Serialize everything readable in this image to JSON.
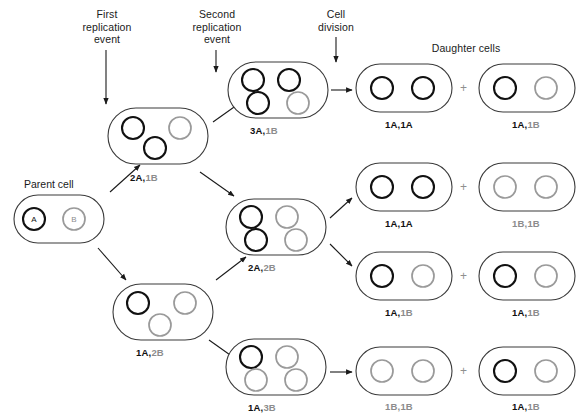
{
  "figure": {
    "colors": {
      "plasmid_a": "#111111",
      "plasmid_b": "#9a9a9a",
      "cell_outline": "#3b3b3b",
      "arrow": "#1a1a1a",
      "text": "#1a1a1a",
      "text_gray": "#8c8c8c"
    }
  },
  "headers": [
    {
      "id": "first-replication-event",
      "text": "First\nreplication\nevent",
      "x": 76,
      "y": 8,
      "width": 62,
      "arrow_x": 106,
      "arrow_y0": 50,
      "arrow_y1": 104
    },
    {
      "id": "second-replication-event",
      "text": "Second\nreplication\nevent",
      "x": 186,
      "y": 8,
      "width": 62,
      "arrow_x": 216,
      "arrow_y0": 50,
      "arrow_y1": 72
    },
    {
      "id": "cell-division",
      "text": "Cell\ndivision",
      "x": 310,
      "y": 8,
      "width": 52,
      "arrow_x": 336,
      "arrow_y0": 37,
      "arrow_y1": 62
    },
    {
      "id": "daughter-cells",
      "text": "Daughter cells",
      "x": 416,
      "y": 42,
      "width": 100,
      "arrow_x": 0,
      "arrow_y0": 0,
      "arrow_y1": 0
    }
  ],
  "parent_caption": {
    "text": "Parent cell",
    "x": 24,
    "y": 178
  },
  "cells": [
    {
      "id": "parent-cell",
      "name": "parent-cell",
      "x": 14,
      "y": 195,
      "w": 90,
      "h": 48,
      "label_a": "",
      "label_b": "",
      "caption_letters": true,
      "plasmids": [
        {
          "type": "A",
          "cx": 34,
          "cy": 219,
          "r": 11,
          "letter": "A"
        },
        {
          "type": "B",
          "cx": 74,
          "cy": 219,
          "r": 11,
          "letter": "B"
        }
      ]
    },
    {
      "id": "cell-2a1b",
      "name": "cell-2A-1B",
      "x": 108,
      "y": 108,
      "w": 100,
      "h": 56,
      "label_a": "2A,",
      "label_b": "1B",
      "label_x": 130,
      "label_y": 172,
      "plasmids": [
        {
          "type": "A",
          "cx": 133,
          "cy": 128,
          "r": 11
        },
        {
          "type": "B",
          "cx": 180,
          "cy": 128,
          "r": 11
        },
        {
          "type": "A",
          "cx": 155,
          "cy": 148,
          "r": 11
        }
      ]
    },
    {
      "id": "cell-3a1b",
      "name": "cell-3A-1B",
      "x": 228,
      "y": 62,
      "w": 100,
      "h": 56,
      "label_a": "3A,",
      "label_b": "1B",
      "label_x": 250,
      "label_y": 125,
      "plasmids": [
        {
          "type": "A",
          "cx": 253,
          "cy": 80,
          "r": 11
        },
        {
          "type": "A",
          "cx": 289,
          "cy": 80,
          "r": 11
        },
        {
          "type": "A",
          "cx": 258,
          "cy": 103,
          "r": 11
        },
        {
          "type": "B",
          "cx": 298,
          "cy": 103,
          "r": 11
        }
      ]
    },
    {
      "id": "cell-1a2b",
      "name": "cell-1A-2B",
      "x": 113,
      "y": 284,
      "w": 100,
      "h": 56,
      "label_a": "1A,",
      "label_b": "2B",
      "label_x": 136,
      "label_y": 347,
      "plasmids": [
        {
          "type": "A",
          "cx": 138,
          "cy": 303,
          "r": 11
        },
        {
          "type": "B",
          "cx": 185,
          "cy": 303,
          "r": 11
        },
        {
          "type": "B",
          "cx": 160,
          "cy": 325,
          "r": 11
        }
      ]
    },
    {
      "id": "cell-2a2b",
      "name": "cell-2A-2B",
      "x": 226,
      "y": 199,
      "w": 100,
      "h": 56,
      "label_a": "2A,",
      "label_b": "2B",
      "label_x": 248,
      "label_y": 262,
      "plasmids": [
        {
          "type": "A",
          "cx": 251,
          "cy": 217,
          "r": 11
        },
        {
          "type": "B",
          "cx": 287,
          "cy": 217,
          "r": 11
        },
        {
          "type": "A",
          "cx": 256,
          "cy": 240,
          "r": 11
        },
        {
          "type": "B",
          "cx": 296,
          "cy": 240,
          "r": 11
        }
      ]
    },
    {
      "id": "cell-1a3b",
      "name": "cell-1A-3B",
      "x": 226,
      "y": 339,
      "w": 100,
      "h": 56,
      "label_a": "1A,",
      "label_b": "3B",
      "label_x": 248,
      "label_y": 402,
      "plasmids": [
        {
          "type": "A",
          "cx": 251,
          "cy": 357,
          "r": 11
        },
        {
          "type": "B",
          "cx": 287,
          "cy": 357,
          "r": 11
        },
        {
          "type": "B",
          "cx": 256,
          "cy": 380,
          "r": 11
        },
        {
          "type": "B",
          "cx": 296,
          "cy": 380,
          "r": 11
        }
      ]
    },
    {
      "id": "daughter-1-left",
      "name": "daughter-cell-1A-1A-top",
      "x": 356,
      "y": 64,
      "w": 96,
      "h": 48,
      "label_a": "1A,1A",
      "label_b": "",
      "label_x": 385,
      "label_y": 119,
      "plasmids": [
        {
          "type": "A",
          "cx": 382,
          "cy": 88,
          "r": 11
        },
        {
          "type": "A",
          "cx": 423,
          "cy": 88,
          "r": 11
        }
      ]
    },
    {
      "id": "daughter-1-right",
      "name": "daughter-cell-1A-1B-top",
      "x": 479,
      "y": 64,
      "w": 96,
      "h": 48,
      "label_a": "1A,",
      "label_b": "1B",
      "label_x": 512,
      "label_y": 119,
      "plasmids": [
        {
          "type": "A",
          "cx": 505,
          "cy": 88,
          "r": 11
        },
        {
          "type": "B",
          "cx": 546,
          "cy": 88,
          "r": 11
        }
      ]
    },
    {
      "id": "daughter-2-left",
      "name": "daughter-cell-1A-1A-second",
      "x": 356,
      "y": 163,
      "w": 96,
      "h": 48,
      "label_a": "1A,1A",
      "label_b": "",
      "label_x": 385,
      "label_y": 218,
      "plasmids": [
        {
          "type": "A",
          "cx": 382,
          "cy": 187,
          "r": 11
        },
        {
          "type": "A",
          "cx": 423,
          "cy": 187,
          "r": 11
        }
      ]
    },
    {
      "id": "daughter-2-right",
      "name": "daughter-cell-1B-1B-second",
      "x": 479,
      "y": 163,
      "w": 96,
      "h": 48,
      "label_a": "",
      "label_b": "1B,1B",
      "label_x": 512,
      "label_y": 218,
      "plasmids": [
        {
          "type": "B",
          "cx": 505,
          "cy": 187,
          "r": 11
        },
        {
          "type": "B",
          "cx": 546,
          "cy": 187,
          "r": 11
        }
      ]
    },
    {
      "id": "daughter-3-left",
      "name": "daughter-cell-1A-1B-third",
      "x": 356,
      "y": 252,
      "w": 96,
      "h": 48,
      "label_a": "1A,",
      "label_b": "1B",
      "label_x": 385,
      "label_y": 307,
      "plasmids": [
        {
          "type": "A",
          "cx": 382,
          "cy": 276,
          "r": 11
        },
        {
          "type": "B",
          "cx": 423,
          "cy": 276,
          "r": 11
        }
      ]
    },
    {
      "id": "daughter-3-right",
      "name": "daughter-cell-1A-1B-third-right",
      "x": 479,
      "y": 252,
      "w": 96,
      "h": 48,
      "label_a": "1A,",
      "label_b": "1B",
      "label_x": 512,
      "label_y": 307,
      "plasmids": [
        {
          "type": "A",
          "cx": 505,
          "cy": 276,
          "r": 11
        },
        {
          "type": "B",
          "cx": 546,
          "cy": 276,
          "r": 11
        }
      ]
    },
    {
      "id": "daughter-4-left",
      "name": "daughter-cell-1B-1B-fourth",
      "x": 356,
      "y": 347,
      "w": 96,
      "h": 48,
      "label_a": "",
      "label_b": "1B,1B",
      "label_x": 385,
      "label_y": 401,
      "plasmids": [
        {
          "type": "B",
          "cx": 382,
          "cy": 371,
          "r": 11
        },
        {
          "type": "B",
          "cx": 423,
          "cy": 371,
          "r": 11
        }
      ]
    },
    {
      "id": "daughter-4-right",
      "name": "daughter-cell-1A-1B-fourth",
      "x": 479,
      "y": 347,
      "w": 96,
      "h": 48,
      "label_a": "1A,",
      "label_b": "1B",
      "label_x": 512,
      "label_y": 401,
      "plasmids": [
        {
          "type": "A",
          "cx": 505,
          "cy": 371,
          "r": 11
        },
        {
          "type": "B",
          "cx": 546,
          "cy": 371,
          "r": 11
        }
      ]
    }
  ],
  "plus_signs": [
    {
      "id": "plus-1",
      "x": 460,
      "y": 82
    },
    {
      "id": "plus-2",
      "x": 460,
      "y": 181
    },
    {
      "id": "plus-3",
      "x": 460,
      "y": 270
    },
    {
      "id": "plus-4",
      "x": 460,
      "y": 365
    }
  ],
  "arrows": [
    {
      "id": "arrow-parent-to-2a1b",
      "x1": 110,
      "y1": 192,
      "x2": 140,
      "y2": 165
    },
    {
      "id": "arrow-parent-to-1a2b",
      "x1": 98,
      "y1": 248,
      "x2": 126,
      "y2": 280
    },
    {
      "id": "arrow-2a1b-to-3a1b",
      "x1": 213,
      "y1": 122,
      "x2": 244,
      "y2": 100
    },
    {
      "id": "arrow-2a1b-to-2a2b",
      "x1": 200,
      "y1": 172,
      "x2": 234,
      "y2": 196
    },
    {
      "id": "arrow-1a2b-to-2a2b",
      "x1": 216,
      "y1": 280,
      "x2": 246,
      "y2": 257
    },
    {
      "id": "arrow-1a2b-to-1a3b",
      "x1": 209,
      "y1": 340,
      "x2": 240,
      "y2": 362
    },
    {
      "id": "arrow-3a1b-division",
      "x1": 331,
      "y1": 90,
      "x2": 352,
      "y2": 90
    },
    {
      "id": "arrow-2a2b-division-up",
      "x1": 330,
      "y1": 218,
      "x2": 352,
      "y2": 198
    },
    {
      "id": "arrow-2a2b-division-down",
      "x1": 330,
      "y1": 244,
      "x2": 352,
      "y2": 266
    },
    {
      "id": "arrow-1a3b-division",
      "x1": 330,
      "y1": 372,
      "x2": 352,
      "y2": 372
    }
  ]
}
